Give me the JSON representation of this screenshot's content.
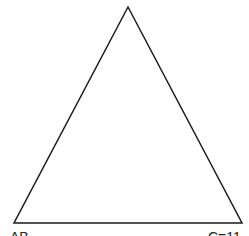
{
  "diagram": {
    "shape": "triangle",
    "stroke_color": "#1a1a1a",
    "fill_color": "#ffffff",
    "stroke_width": 1.5,
    "vertices": {
      "apex": [
        128,
        7
      ],
      "bottom_left": [
        14,
        223
      ],
      "bottom_right": [
        242,
        223
      ]
    },
    "labels": {
      "bottom_left": "AB",
      "bottom_right": "C=11"
    }
  }
}
